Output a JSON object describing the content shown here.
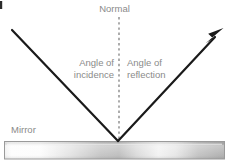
{
  "diagram": {
    "labels": {
      "normal": "Normal",
      "angle_of_incidence_line1": "Angle of",
      "angle_of_incidence_line2": "incidence",
      "angle_of_reflection_line1": "Angle of",
      "angle_of_reflection_line2": "reflection",
      "mirror": "Mirror"
    },
    "colors": {
      "ray": "#1a1a1a",
      "normal_line": "#8a8a8a",
      "text": "#8a8a8a",
      "mirror_border": "#9a9a9a",
      "mirror_light": "#fdfdfd",
      "mirror_mid": "#c9c9c9",
      "mirror_dark": "#a8a8a8",
      "background": "#ffffff"
    },
    "geometry": {
      "incident_ray": {
        "from_x": 12,
        "from_y": 30,
        "to_x": 118,
        "to_y": 141,
        "arrowhead": false
      },
      "reflected_ray": {
        "from_x": 118,
        "from_y": 141,
        "to_x": 222,
        "to_y": 30,
        "arrowhead": true
      },
      "normal_line": {
        "x": 119,
        "from_y": 17,
        "to_y": 140,
        "style": "dashed"
      },
      "mirror_bar": {
        "x": 4,
        "y": 141,
        "width": 221,
        "height": 18
      }
    }
  }
}
